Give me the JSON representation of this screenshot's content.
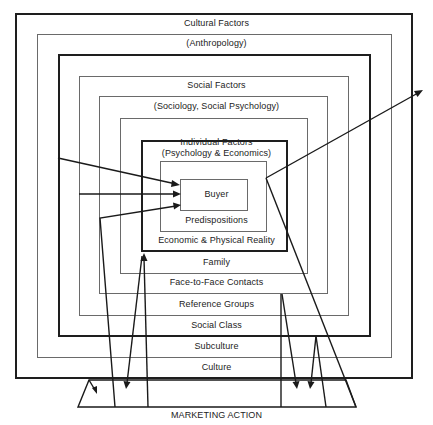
{
  "diagram": {
    "layers": {
      "cultural": {
        "title": "Cultural Factors",
        "subtitle": "(Anthropology)"
      },
      "social": {
        "title": "Social Factors",
        "subtitle": "(Sociology, Social Psychology)"
      },
      "individual": {
        "title": "Individual Factors",
        "subtitle": "(Psychology & Economics)"
      }
    },
    "center": "Buyer",
    "rings": {
      "predispositions": "Predispositions",
      "economic_reality": "Economic & Physical Reality",
      "family": "Family",
      "face_to_face": "Face-to-Face Contacts",
      "reference_groups": "Reference Groups",
      "social_class": "Social Class",
      "subculture": "Subculture",
      "culture": "Culture"
    },
    "base": "MARKETING ACTION"
  }
}
